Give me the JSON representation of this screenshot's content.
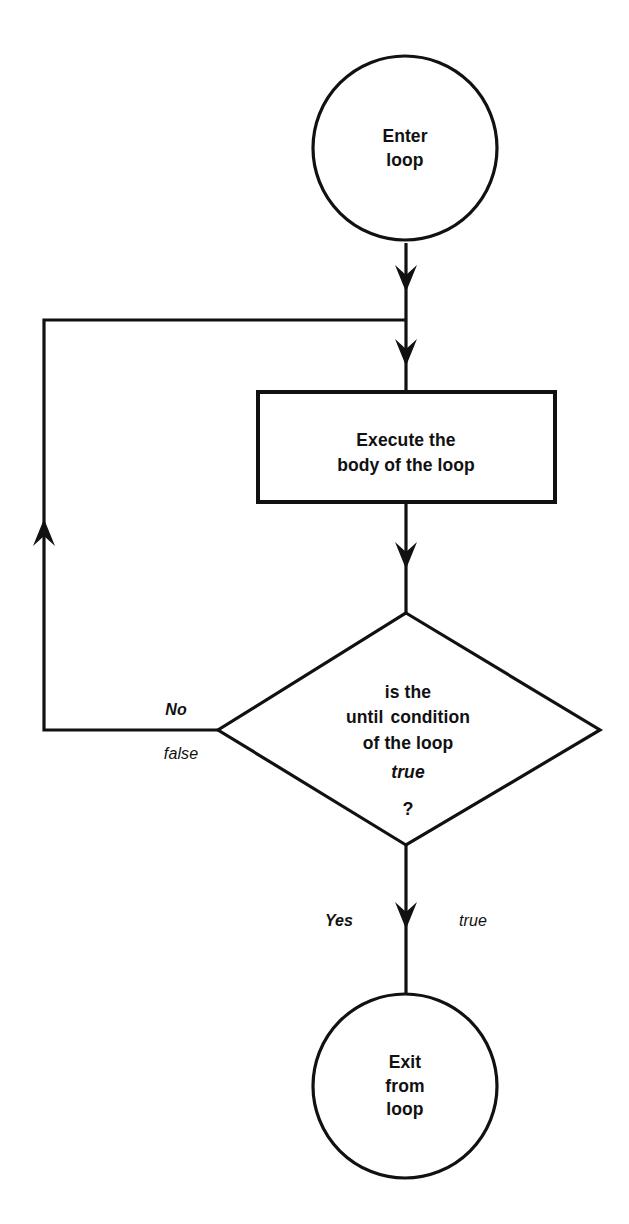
{
  "diagram": {
    "type": "flowchart",
    "background_color": "#ffffff",
    "line_color": "#111111",
    "nodes": {
      "start": {
        "shape": "circle",
        "lines": [
          "Enter",
          "loop"
        ]
      },
      "process": {
        "shape": "rectangle",
        "lines": [
          "Execute the",
          "body of the loop"
        ]
      },
      "decision": {
        "shape": "diamond",
        "line1": "is the",
        "line2_keyword": "until",
        "line2_rest": "condition",
        "line3": "of the loop",
        "line4": "true",
        "line5": "?"
      },
      "end": {
        "shape": "circle",
        "lines": [
          "Exit",
          "from",
          "loop"
        ]
      }
    },
    "edges": {
      "no_branch": {
        "label_primary": "No",
        "label_secondary": "false"
      },
      "yes_branch": {
        "label_primary": "Yes",
        "label_secondary": "true"
      }
    }
  }
}
